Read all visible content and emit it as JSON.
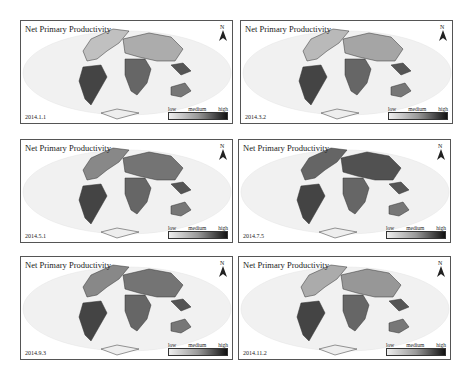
{
  "common": {
    "title": "Net Primary Productivity",
    "north_label": "N",
    "legend": {
      "low": "low",
      "medium": "medium",
      "high": "high"
    }
  },
  "panels": [
    {
      "date": "2014.1.1",
      "north_intensity": 0.2
    },
    {
      "date": "2014.3.2",
      "north_intensity": 0.25
    },
    {
      "date": "2014.5.1",
      "north_intensity": 0.6
    },
    {
      "date": "2014.7.5",
      "north_intensity": 0.85
    },
    {
      "date": "2014.9.3",
      "north_intensity": 0.6
    },
    {
      "date": "2014.11.2",
      "north_intensity": 0.35
    }
  ]
}
